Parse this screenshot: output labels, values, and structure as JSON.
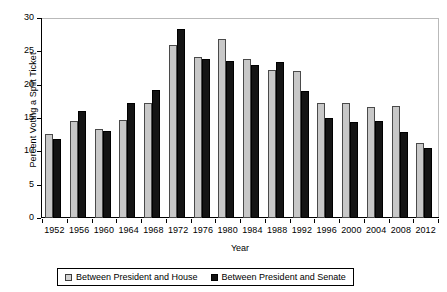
{
  "chart_data": {
    "type": "bar",
    "title": "",
    "xlabel": "Year",
    "ylabel": "Percent Voting a Split Ticket",
    "ylim": [
      0,
      30
    ],
    "yticks": [
      0,
      5,
      10,
      15,
      20,
      25,
      30
    ],
    "ytick_labels": [
      "0",
      "5",
      "10",
      "15",
      "20",
      "25",
      "30"
    ],
    "grid": false,
    "legend_position": "bottom",
    "categories": [
      "1952",
      "1956",
      "1960",
      "1964",
      "1968",
      "1972",
      "1976",
      "1980",
      "1984",
      "1988",
      "1992",
      "1996",
      "2000",
      "2004",
      "2008",
      "2012"
    ],
    "series": [
      {
        "name": "Between President and House",
        "color": "#c8c8c8",
        "values": [
          12.6,
          14.6,
          13.3,
          14.7,
          17.3,
          25.9,
          24.2,
          26.8,
          23.9,
          22.2,
          22.0,
          17.2,
          17.2,
          16.6,
          16.8,
          11.2
        ]
      },
      {
        "name": "Between President and Senate",
        "color": "#141414",
        "values": [
          11.9,
          16.1,
          13.0,
          17.2,
          19.2,
          28.4,
          23.8,
          23.5,
          23.0,
          23.4,
          19.0,
          15.0,
          14.4,
          14.5,
          12.9,
          10.5
        ]
      }
    ]
  }
}
